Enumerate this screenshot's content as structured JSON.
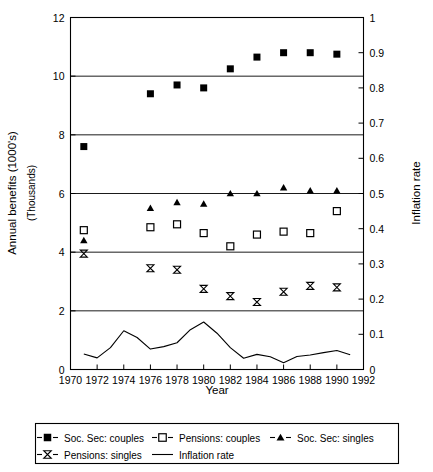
{
  "chart_data": {
    "type": "scatter",
    "title": "",
    "xlabel": "Year",
    "ylabel": "Annual benefits (1000's)",
    "ylabel_sub": "(Thousands)",
    "y2label": "Inflation rate",
    "xlim": [
      1970,
      1992
    ],
    "ylim": [
      0,
      12
    ],
    "y2lim": [
      0,
      1
    ],
    "grid": true,
    "legend_position": "bottom",
    "x_ticks": [
      1970,
      1972,
      1974,
      1976,
      1978,
      1980,
      1982,
      1984,
      1986,
      1988,
      1990,
      1992
    ],
    "x_tick_labels": [
      "1970",
      "1972",
      "1974",
      "1976",
      "1978",
      "1980",
      "1982",
      "1984",
      "1986",
      "1988",
      "1990",
      "1992"
    ],
    "y_ticks": [
      0,
      2,
      4,
      6,
      8,
      10,
      12
    ],
    "y_tick_labels": [
      "0",
      "2",
      "4",
      "6",
      "8",
      "10",
      "12"
    ],
    "y2_ticks": [
      0,
      0.1,
      0.2,
      0.3,
      0.4,
      0.5,
      0.6,
      0.7,
      0.8,
      0.9,
      1
    ],
    "y2_tick_labels": [
      "0",
      "0.1",
      "0.2",
      "0.3",
      "0.4",
      "0.5",
      "0.6",
      "0.7",
      "0.8",
      "0.9",
      "1"
    ],
    "gridlines_y": [
      2,
      4,
      6,
      8,
      10
    ],
    "series": [
      {
        "name": "Soc. Sec: couples",
        "marker": "filled-square",
        "axis": "left",
        "x": [
          1971,
          1976,
          1978,
          1980,
          1982,
          1984,
          1986,
          1988,
          1990
        ],
        "values": [
          7.6,
          9.4,
          9.7,
          9.6,
          10.25,
          10.65,
          10.8,
          10.8,
          10.75
        ]
      },
      {
        "name": "Pensions: couples",
        "marker": "open-square",
        "axis": "left",
        "x": [
          1971,
          1976,
          1978,
          1980,
          1982,
          1984,
          1986,
          1988,
          1990
        ],
        "values": [
          4.75,
          4.85,
          4.95,
          4.65,
          4.2,
          4.6,
          4.7,
          4.65,
          5.4
        ]
      },
      {
        "name": "Soc. Sec: singles",
        "marker": "filled-triangle",
        "axis": "left",
        "x": [
          1971,
          1976,
          1978,
          1980,
          1982,
          1984,
          1986,
          1988,
          1990
        ],
        "values": [
          4.4,
          5.5,
          5.7,
          5.65,
          6.0,
          6.0,
          6.2,
          6.1,
          6.1
        ]
      },
      {
        "name": "Pensions: singles",
        "marker": "bowtie",
        "axis": "left",
        "x": [
          1971,
          1976,
          1978,
          1980,
          1982,
          1984,
          1986,
          1988,
          1990
        ],
        "values": [
          3.95,
          3.45,
          3.4,
          2.75,
          2.5,
          2.3,
          2.65,
          2.85,
          2.8
        ]
      },
      {
        "name": "Inflation rate",
        "marker": "line",
        "axis": "right",
        "x": [
          1971,
          1972,
          1973,
          1974,
          1975,
          1976,
          1977,
          1978,
          1979,
          1980,
          1981,
          1982,
          1983,
          1984,
          1985,
          1986,
          1987,
          1988,
          1989,
          1990,
          1991
        ],
        "values": [
          0.044,
          0.033,
          0.062,
          0.11,
          0.091,
          0.058,
          0.065,
          0.076,
          0.113,
          0.135,
          0.103,
          0.062,
          0.032,
          0.043,
          0.036,
          0.019,
          0.037,
          0.041,
          0.048,
          0.054,
          0.042
        ]
      }
    ]
  },
  "legend": {
    "entries": [
      {
        "label": "Soc. Sec: couples",
        "marker": "filled-square"
      },
      {
        "label": "Pensions: couples",
        "marker": "open-square"
      },
      {
        "label": "Soc. Sec: singles",
        "marker": "filled-triangle"
      },
      {
        "label": "Pensions: singles",
        "marker": "bowtie"
      },
      {
        "label": "Inflation rate",
        "marker": "line"
      }
    ]
  },
  "colors": {
    "ink": "#000000",
    "background": "#ffffff"
  }
}
